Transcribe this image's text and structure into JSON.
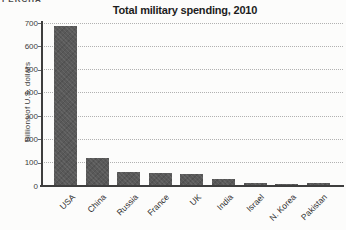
{
  "page": {
    "clipped_header_fragment": "PERCHA"
  },
  "chart_data": {
    "type": "bar",
    "title": "Total military spending, 2010",
    "xlabel": "",
    "ylabel": "Billions of U.S. dollars",
    "categories": [
      "USA",
      "China",
      "Russia",
      "France",
      "UK",
      "India",
      "Israel",
      "N. Korea",
      "Pakistan"
    ],
    "values": [
      685,
      120,
      62,
      56,
      53,
      30,
      14,
      10,
      11
    ],
    "ylim": [
      0,
      700
    ],
    "yticks": [
      0,
      100,
      200,
      300,
      400,
      500,
      600,
      700
    ],
    "grid": "horizontal-dotted",
    "legend": "none",
    "x_tick_rotation_deg": 45,
    "colors": {
      "bar": "#595959",
      "axis": "#3e3e3e",
      "gridline": "#b1b1b1",
      "title_text": "#1d1d1d",
      "tick_text": "#3d3d3d",
      "background": "#fcfcfb"
    }
  }
}
